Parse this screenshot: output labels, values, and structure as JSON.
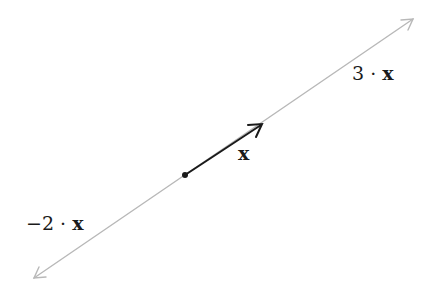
{
  "diagram": {
    "line_color": "#b8b8b8",
    "vector_color": "#1a1a1a",
    "origin": {
      "x": 185,
      "y": 175
    },
    "span_line": {
      "start": {
        "x": 34,
        "y": 278
      },
      "end": {
        "x": 413,
        "y": 19
      }
    },
    "vector": {
      "tip": {
        "x": 262,
        "y": 124
      }
    },
    "labels": {
      "pos_multiple_coef": "3 · ",
      "pos_multiple_var": "x",
      "vector_var": "x",
      "neg_multiple_coef": "−2 · ",
      "neg_multiple_var": "x"
    }
  }
}
